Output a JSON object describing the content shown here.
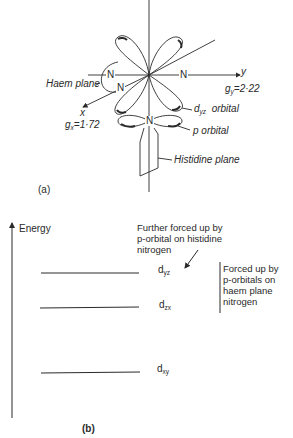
{
  "panel_a": {
    "label": "(a)",
    "axis_y_label": "y",
    "axis_x_label": "x",
    "gy_text": "g",
    "gy_sub": "y",
    "gy_value": "=2·22",
    "gx_text": "g",
    "gx_sub": "x",
    "gx_value": "=1·72",
    "atoms": {
      "n_left": "N",
      "n_right": "N",
      "n_front": "N",
      "n_histidine": "N"
    },
    "haem_plane_label": "Haem plane",
    "dyz_label_d": "d",
    "dyz_label_sub": "yz",
    "dyz_label_word": "orbital",
    "p_orbital_label": "p orbital",
    "histidine_plane_label": "Histidine plane"
  },
  "panel_b": {
    "label": "(b)",
    "axis_label": "Energy",
    "levels": [
      {
        "name": "d",
        "sub": "yz",
        "rank": 1
      },
      {
        "name": "d",
        "sub": "zx",
        "rank": 2
      },
      {
        "name": "d",
        "sub": "xy",
        "rank": 3
      }
    ],
    "annotation_top": [
      "Further forced up by",
      "p-orbital on histidine",
      "nitrogen"
    ],
    "annotation_side": [
      "Forced up by",
      "p-orbitals on",
      "haem plane",
      "nitrogen"
    ]
  },
  "colors": {
    "ink": "#2a2a2a",
    "background": "#ffffff"
  }
}
